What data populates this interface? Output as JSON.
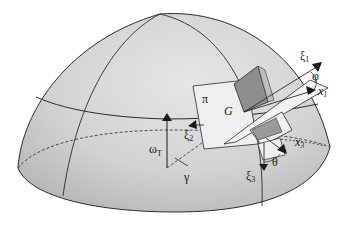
{
  "figure": {
    "colors": {
      "dome_fill_light": "#e4e4e4",
      "dome_fill_dark": "#b9b9b9",
      "line": "#2b2b2b",
      "plane_light": "#efefef",
      "plane_dark": "#8e8e8e",
      "plane_mid": "#bdbdbd"
    }
  },
  "labels": {
    "xi1": {
      "main": "ξ",
      "sub": "1"
    },
    "phi": {
      "main": "φ"
    },
    "x1": {
      "main": "x",
      "sub": "1"
    },
    "pi": {
      "main": "π"
    },
    "G": {
      "main": "G"
    },
    "xi2": {
      "main": "ξ",
      "sub": "2"
    },
    "omegaT": {
      "main": "ω",
      "sub": "T"
    },
    "gamma": {
      "main": "γ"
    },
    "x3": {
      "main": "x",
      "sub": "3"
    },
    "theta": {
      "main": "θ"
    },
    "xi3": {
      "main": "ξ",
      "sub": "3"
    }
  }
}
